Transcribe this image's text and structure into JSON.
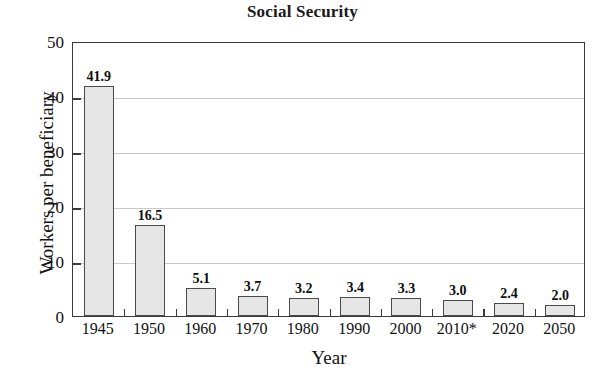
{
  "chart_data": {
    "type": "bar",
    "title": "Social Security",
    "xlabel": "Year",
    "ylabel": "Workers per beneficiary",
    "categories": [
      "1945",
      "1950",
      "1960",
      "1970",
      "1980",
      "1990",
      "2000",
      "2010*",
      "2020",
      "2050"
    ],
    "values": [
      41.9,
      16.5,
      5.1,
      3.7,
      3.2,
      3.4,
      3.3,
      3.0,
      2.4,
      2.0
    ],
    "value_labels": [
      "41.9",
      "16.5",
      "5.1",
      "3.7",
      "3.2",
      "3.4",
      "3.3",
      "3.0",
      "2.4",
      "2.0"
    ],
    "ylim": [
      0,
      50
    ],
    "yticks": [
      0,
      10,
      20,
      30,
      40,
      50
    ],
    "ytick_labels": [
      "0",
      "10",
      "20",
      "30",
      "40",
      "50"
    ],
    "grid": true,
    "legend": "none",
    "colors": {
      "bar_fill": "#e6e6e6",
      "bar_border": "#4a4a4a",
      "axis": "#3a3a3a",
      "gridline": "#c9c9c9",
      "text": "#111111",
      "background": "#ffffff"
    }
  }
}
